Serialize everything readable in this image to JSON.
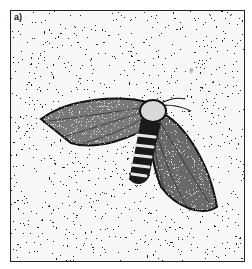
{
  "figure": {
    "panel_label": "a)",
    "style": "black-and-white stipple illustration",
    "colors": {
      "ink": "#111111",
      "paper": "#ffffff",
      "frame": "#222222"
    }
  }
}
